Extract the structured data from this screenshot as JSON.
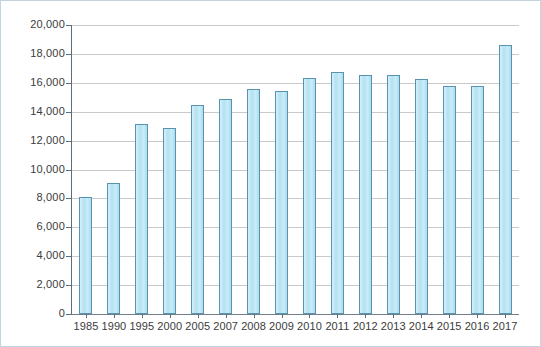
{
  "chart_data": {
    "type": "bar",
    "title": "",
    "subtitle": "",
    "xlabel": "",
    "ylabel": "",
    "categories": [
      "1985",
      "1990",
      "1995",
      "2000",
      "2005",
      "2007",
      "2008",
      "2009",
      "2010",
      "2011",
      "2012",
      "2013",
      "2014",
      "2015",
      "2016",
      "2017"
    ],
    "values": [
      8100,
      9050,
      13150,
      12880,
      14450,
      14880,
      15570,
      15430,
      16330,
      16730,
      16520,
      16540,
      16270,
      15800,
      15750,
      18620
    ],
    "ylim": [
      0,
      20000
    ],
    "ytick_labels": [
      "20,000",
      "18,000",
      "16,000",
      "14,000",
      "12,000",
      "10,000",
      "8,000",
      "6,000",
      "4,000",
      "2,000",
      "0"
    ],
    "ytick_values": [
      20000,
      18000,
      16000,
      14000,
      12000,
      10000,
      8000,
      6000,
      4000,
      2000,
      0
    ],
    "grid": true,
    "legend": [],
    "legend_position": "none",
    "series": [
      {
        "name": "",
        "color": "#bde7f4",
        "border_color": "#5a93ad",
        "values": [
          8100,
          9050,
          13150,
          12880,
          14450,
          14880,
          15570,
          15430,
          16330,
          16730,
          16520,
          16540,
          16270,
          15800,
          15750,
          18620
        ]
      }
    ],
    "annotations": []
  },
  "style": {
    "bar_fill": "#bde7f4",
    "bar_border": "#5a93ad",
    "gridline_color": "#c9c9c9",
    "axis_color": "#5d6e7b",
    "frame_border": "#c3d4e0",
    "background": "#ffffff",
    "tick_text_color": "#3b3b3b"
  }
}
